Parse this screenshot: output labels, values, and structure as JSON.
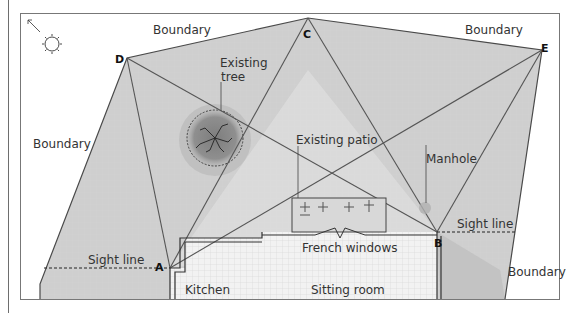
{
  "diagram": {
    "type": "garden-plan-sight-lines",
    "colors": {
      "shade": "#c9c9c9",
      "grid": "#d6d6d6",
      "lines": "#555555",
      "tree": "#8a8a8a",
      "text": "#333333"
    },
    "points": [
      {
        "id": "A",
        "label": "A",
        "x": 170,
        "y": 268
      },
      {
        "id": "B",
        "label": "B",
        "x": 437,
        "y": 232
      },
      {
        "id": "C",
        "label": "C",
        "x": 308,
        "y": 18
      },
      {
        "id": "D",
        "label": "D",
        "x": 127,
        "y": 58
      },
      {
        "id": "E",
        "label": "E",
        "x": 542,
        "y": 50
      }
    ],
    "labels": {
      "boundary_top_left": "Boundary",
      "boundary_top_right": "Boundary",
      "boundary_left": "Boundary",
      "boundary_bottom_right": "Boundary",
      "existing_tree": "Existing\ntree",
      "existing_tree_line1": "Existing",
      "existing_tree_line2": "tree",
      "existing_patio": "Existing patio",
      "manhole": "Manhole",
      "sight_line_left": "Sight line",
      "sight_line_right": "Sight line",
      "french_windows": "French windows",
      "kitchen": "Kitchen",
      "sitting_room": "Sitting room"
    },
    "icons": {
      "sun": "sun-icon",
      "north_arrow": "north-arrow-icon"
    }
  }
}
